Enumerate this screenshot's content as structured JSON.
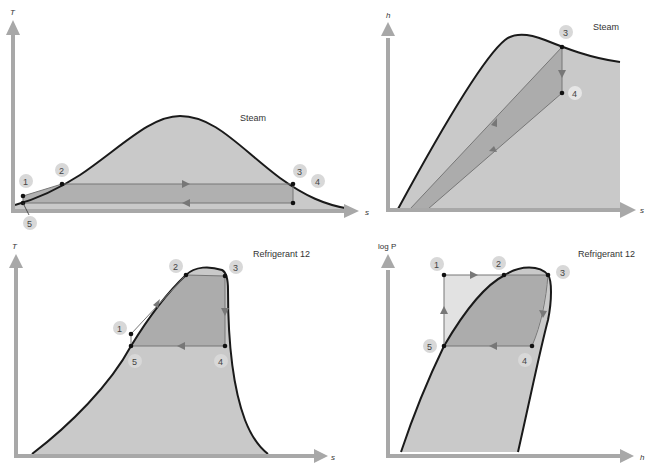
{
  "colors": {
    "background": "#ffffff",
    "axis": "#a8a8a8",
    "dome_fill": "#c9c9c9",
    "cycle_fill": "#acacac",
    "cycle_fill_light": "#dedede",
    "curve": "#1a1a1a",
    "process_line": "#777777",
    "point": "#111111",
    "label_bubble": "#d8d8d8"
  },
  "diagrams": [
    {
      "id": "steam-ts",
      "title": "Steam",
      "x_axis_label": "s",
      "y_axis_label": "T",
      "points": [
        {
          "label": "1"
        },
        {
          "label": "2"
        },
        {
          "label": "3"
        },
        {
          "label": "4"
        },
        {
          "label": "5"
        }
      ]
    },
    {
      "id": "steam-hs",
      "title": "Steam",
      "x_axis_label": "s",
      "y_axis_label": "h",
      "points": [
        {
          "label": "3"
        },
        {
          "label": "4"
        }
      ]
    },
    {
      "id": "r12-ts",
      "title": "Refrigerant 12",
      "x_axis_label": "s",
      "y_axis_label": "T",
      "points": [
        {
          "label": "1"
        },
        {
          "label": "2"
        },
        {
          "label": "3"
        },
        {
          "label": "4"
        },
        {
          "label": "5"
        }
      ]
    },
    {
      "id": "r12-logph",
      "title": "Refrigerant 12",
      "x_axis_label": "h",
      "y_axis_label": "log P",
      "points": [
        {
          "label": "1"
        },
        {
          "label": "2"
        },
        {
          "label": "3"
        },
        {
          "label": "4"
        },
        {
          "label": "5"
        }
      ]
    }
  ]
}
